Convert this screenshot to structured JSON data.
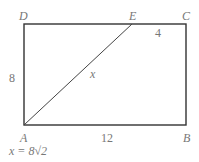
{
  "diagram": {
    "vertices": {
      "A": {
        "label": "A",
        "x": 24,
        "y": 125
      },
      "B": {
        "label": "B",
        "x": 186,
        "y": 125
      },
      "C": {
        "label": "C",
        "x": 186,
        "y": 24
      },
      "D": {
        "label": "D",
        "x": 24,
        "y": 24
      },
      "E": {
        "label": "E",
        "x": 132,
        "y": 24
      }
    },
    "side_labels": {
      "AD": "8",
      "AB": "12",
      "EC": "4",
      "AE": "x"
    },
    "answer": "x = 8√2",
    "colors": {
      "line": "#333333",
      "text": "#777777"
    }
  }
}
